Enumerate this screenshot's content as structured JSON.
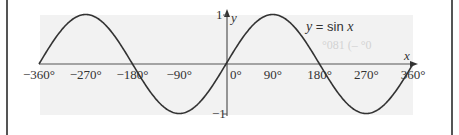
{
  "chart_data": {
    "type": "line",
    "title": "",
    "legend": "y = sin x",
    "xlabel": "x",
    "ylabel": "y",
    "xlim": [
      -360,
      360
    ],
    "ylim": [
      -1,
      1
    ],
    "grid": false,
    "x_ticks": [
      "−360°",
      "−270°",
      "−180°",
      "−90°",
      "0°",
      "90°",
      "180°",
      "270°",
      "360°"
    ],
    "y_ticks": [
      "1",
      "−1"
    ],
    "series": [
      {
        "name": "y = sin x",
        "x": [
          -360,
          -315,
          -270,
          -225,
          -180,
          -135,
          -90,
          -45,
          0,
          45,
          90,
          135,
          180,
          225,
          270,
          315,
          360
        ],
        "values": [
          0,
          0.707,
          1,
          0.707,
          0,
          -0.707,
          -1,
          -0.707,
          0,
          0.707,
          1,
          0.707,
          0,
          -0.707,
          -1,
          -0.707,
          0
        ]
      }
    ],
    "annotations": [
      "y = sin x"
    ],
    "colors": {
      "curve": "#333333",
      "axes": "#555555",
      "plot_bg": "#f2f2f2",
      "frame": "#555555"
    }
  },
  "labels": {
    "eq_y": "y",
    "eq_mid": " = sin ",
    "eq_x": "x",
    "x_axis": "x",
    "y_axis": "y",
    "y_max": "1",
    "y_min": "−1",
    "ghost": "°081 (– °0"
  }
}
